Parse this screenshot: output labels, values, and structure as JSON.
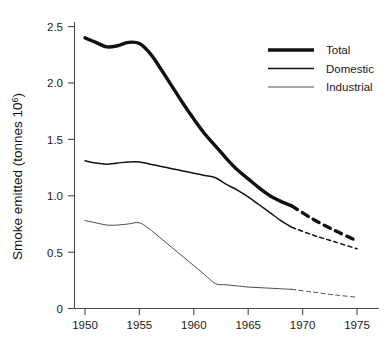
{
  "chart_data": {
    "type": "line",
    "title": "",
    "xlabel": "",
    "ylabel": "Smoke emitted (tonnes 10",
    "ylabel_superscript": "6",
    "ylabel_suffix": ")",
    "xlim": [
      1949,
      1977
    ],
    "ylim": [
      0,
      2.6
    ],
    "grid": false,
    "legend_position": "top-right",
    "x_ticks": [
      "1950",
      "1955",
      "1960",
      "1965",
      "1970",
      "1975"
    ],
    "x_tick_values": [
      1950,
      1955,
      1960,
      1965,
      1970,
      1975
    ],
    "y_ticks": [
      "0",
      "0.5",
      "1.0",
      "1.5",
      "2.0",
      "2.5"
    ],
    "y_tick_values": [
      0,
      0.5,
      1.0,
      1.5,
      2.0,
      2.5
    ],
    "series": [
      {
        "name": "Total",
        "style": "thick",
        "stroke_width": 3.4,
        "color": "#111111",
        "solid_x": [
          1950,
          1951,
          1952,
          1953,
          1954,
          1955,
          1956,
          1957,
          1958,
          1959,
          1960,
          1961,
          1962,
          1963,
          1964,
          1965,
          1966,
          1967,
          1968,
          1969
        ],
        "solid_values": [
          2.4,
          2.36,
          2.32,
          2.33,
          2.36,
          2.35,
          2.26,
          2.12,
          1.97,
          1.82,
          1.68,
          1.55,
          1.44,
          1.33,
          1.23,
          1.15,
          1.07,
          1.0,
          0.95,
          0.91
        ],
        "dashed_x": [
          1969,
          1971,
          1973,
          1975
        ],
        "dashed_values": [
          0.91,
          0.79,
          0.69,
          0.6
        ]
      },
      {
        "name": "Domestic",
        "style": "medium",
        "stroke_width": 1.5,
        "color": "#111111",
        "solid_x": [
          1950,
          1951,
          1952,
          1953,
          1954,
          1955,
          1956,
          1957,
          1958,
          1959,
          1960,
          1961,
          1962,
          1963,
          1964,
          1965,
          1966,
          1967,
          1968,
          1969
        ],
        "solid_values": [
          1.31,
          1.29,
          1.28,
          1.29,
          1.3,
          1.3,
          1.28,
          1.26,
          1.24,
          1.22,
          1.2,
          1.18,
          1.16,
          1.1,
          1.05,
          0.99,
          0.92,
          0.85,
          0.78,
          0.72
        ],
        "dashed_x": [
          1969,
          1971,
          1973,
          1975
        ],
        "dashed_values": [
          0.72,
          0.65,
          0.59,
          0.53
        ]
      },
      {
        "name": "Industrial",
        "style": "thin",
        "stroke_width": 0.9,
        "color": "#3a3a3a",
        "solid_x": [
          1950,
          1951,
          1952,
          1953,
          1954,
          1955,
          1956,
          1957,
          1958,
          1959,
          1960,
          1961,
          1962,
          1963,
          1964,
          1965,
          1966,
          1967,
          1968,
          1969
        ],
        "solid_values": [
          0.78,
          0.76,
          0.74,
          0.74,
          0.75,
          0.76,
          0.7,
          0.62,
          0.54,
          0.46,
          0.38,
          0.3,
          0.22,
          0.21,
          0.2,
          0.19,
          0.185,
          0.18,
          0.175,
          0.17
        ],
        "dashed_x": [
          1969,
          1971,
          1973,
          1975
        ],
        "dashed_values": [
          0.17,
          0.145,
          0.12,
          0.1
        ]
      }
    ]
  },
  "legend": {
    "entries": [
      {
        "label": "Total"
      },
      {
        "label": "Domestic"
      },
      {
        "label": "Industrial"
      }
    ]
  }
}
